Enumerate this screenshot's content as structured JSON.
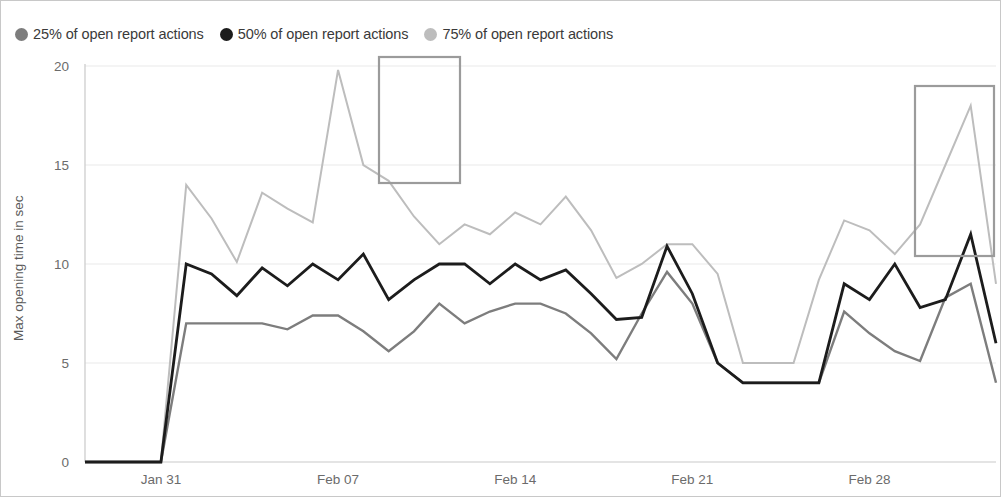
{
  "legend": {
    "items": [
      {
        "label": "25% of open report actions",
        "color": "#7d7d7d",
        "marker": "circle-marker-icon"
      },
      {
        "label": "50% of open report actions",
        "color": "#1c1c1c",
        "marker": "circle-marker-icon"
      },
      {
        "label": "75% of open report actions",
        "color": "#bdbdbd",
        "marker": "circle-marker-icon"
      }
    ]
  },
  "axes": {
    "y_title": "Max opening time in sec",
    "y_ticks": [
      "0",
      "5",
      "10",
      "15",
      "20"
    ],
    "x_ticks": [
      "Jan 31",
      "Feb 07",
      "Feb 14",
      "Feb 21",
      "Feb 28"
    ]
  },
  "annotations": [
    {
      "name": "highlight-box-1",
      "x": 378,
      "y": 56,
      "width": 81,
      "height": 126,
      "color": "#9b9b9b"
    },
    {
      "name": "highlight-box-2",
      "x": 914,
      "y": 85,
      "width": 79,
      "height": 170,
      "color": "#9b9b9b"
    }
  ],
  "chart_data": {
    "type": "line",
    "title": "",
    "xlabel": "",
    "ylabel": "Max opening time in sec",
    "ylim": [
      0,
      20
    ],
    "grid": true,
    "legend_position": "top-left",
    "x_tick_labels": [
      "Jan 31",
      "Feb 07",
      "Feb 14",
      "Feb 21",
      "Feb 28"
    ],
    "x_tick_indices": [
      3,
      10,
      17,
      24,
      31
    ],
    "x": [
      0,
      1,
      2,
      3,
      4,
      5,
      6,
      7,
      8,
      9,
      10,
      11,
      12,
      13,
      14,
      15,
      16,
      17,
      18,
      19,
      20,
      21,
      22,
      23,
      24,
      25,
      26,
      27,
      28,
      29,
      30,
      31,
      32,
      33,
      34,
      35,
      36
    ],
    "series": [
      {
        "name": "25% of open report actions",
        "color": "#7d7d7d",
        "values": [
          0,
          0,
          0,
          0,
          7,
          7,
          7,
          7,
          6.7,
          7.4,
          7.4,
          6.6,
          5.6,
          6.6,
          8,
          7,
          7.6,
          8,
          8,
          7.5,
          6.5,
          5.2,
          7.5,
          9.6,
          8,
          5,
          4,
          4,
          4,
          4,
          7.6,
          6.5,
          5.6,
          5.1,
          8.3,
          9,
          4
        ]
      },
      {
        "name": "50% of open report actions",
        "color": "#1c1c1c",
        "values": [
          0,
          0,
          0,
          0,
          10,
          9.5,
          8.4,
          9.8,
          8.9,
          10,
          9.2,
          10.5,
          8.2,
          9.2,
          10,
          10,
          9,
          10,
          9.2,
          9.7,
          8.5,
          7.2,
          7.3,
          10.9,
          8.5,
          5,
          4,
          4,
          4,
          4,
          9,
          8.2,
          10,
          7.8,
          8.2,
          11.5,
          6
        ]
      },
      {
        "name": "75% of open report actions",
        "color": "#bdbdbd",
        "values": [
          0,
          0,
          0,
          0,
          14,
          12.3,
          10.1,
          13.6,
          12.8,
          12.1,
          19.8,
          15,
          14.2,
          12.4,
          11,
          12,
          11.5,
          12.6,
          12,
          13.4,
          11.7,
          9.3,
          10,
          11,
          11,
          9.5,
          5,
          5,
          5,
          9.2,
          12.2,
          11.7,
          10.5,
          12,
          15,
          18,
          9
        ]
      }
    ]
  }
}
